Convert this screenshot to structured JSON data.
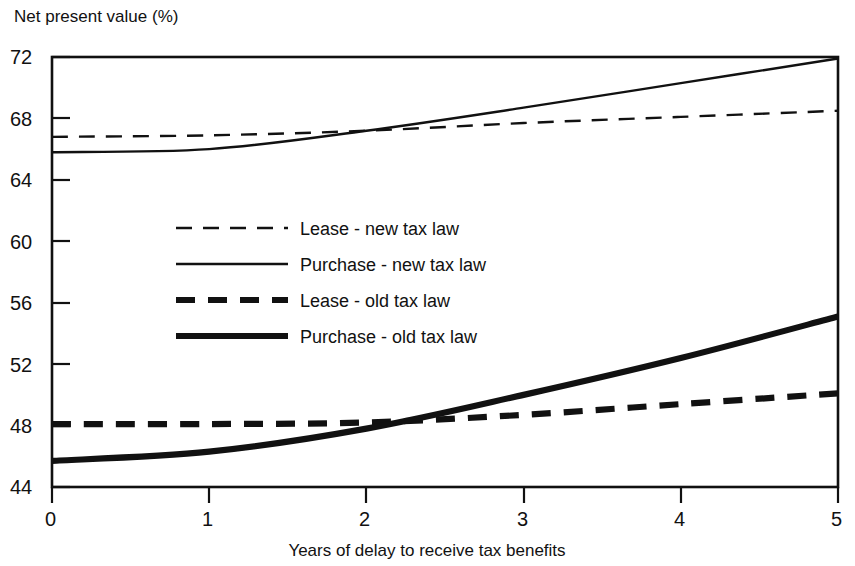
{
  "chart_data": {
    "type": "line",
    "title": "",
    "ylabel": "Net present value (%)",
    "xlabel": "Years of delay to receive tax benefits",
    "xlim": [
      0,
      5
    ],
    "ylim": [
      44,
      72
    ],
    "xticks": [
      "0",
      "1",
      "2",
      "3",
      "4",
      "5"
    ],
    "yticks": [
      "44",
      "48",
      "52",
      "56",
      "60",
      "64",
      "68",
      "72"
    ],
    "grid": false,
    "legend_position": "center-left-inside",
    "x": [
      0,
      1,
      2,
      3,
      4,
      5
    ],
    "series": [
      {
        "name": "Lease - new tax law",
        "style": "dashed-thin",
        "values": [
          66.8,
          66.9,
          67.2,
          67.7,
          68.1,
          68.5
        ]
      },
      {
        "name": "Purchase - new tax law",
        "style": "solid-thin",
        "values": [
          65.8,
          66.0,
          67.2,
          68.7,
          70.3,
          71.9
        ]
      },
      {
        "name": "Lease - old tax law",
        "style": "dashed-thick",
        "values": [
          48.1,
          48.1,
          48.2,
          48.7,
          49.4,
          50.1
        ]
      },
      {
        "name": "Purchase - old tax law",
        "style": "solid-thick",
        "values": [
          45.7,
          46.3,
          47.8,
          50.0,
          52.4,
          55.1
        ]
      }
    ]
  },
  "legend": {
    "items": [
      {
        "label": "Lease - new tax law",
        "style": "dashed-thin"
      },
      {
        "label": "Purchase - new tax law",
        "style": "solid-thin"
      },
      {
        "label": "Lease - old tax law",
        "style": "dashed-thick"
      },
      {
        "label": "Purchase - old tax law",
        "style": "solid-thick"
      }
    ]
  },
  "colors": {
    "ink": "#111111",
    "background": "#ffffff"
  }
}
